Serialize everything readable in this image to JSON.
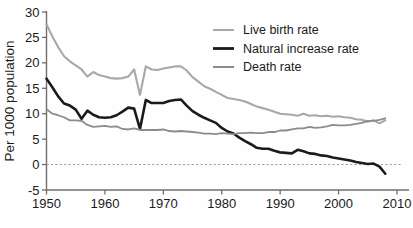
{
  "chart_data": {
    "type": "line",
    "title": "",
    "subtitle": "",
    "xlabel": "",
    "ylabel": "Per 1000 population",
    "xlim": [
      1950,
      2010
    ],
    "ylim": [
      -5,
      30
    ],
    "xticks": [
      "1950",
      "1960",
      "1970",
      "1980",
      "1990",
      "2000",
      "2010"
    ],
    "xtick_values": [
      1950,
      1960,
      1970,
      1980,
      1990,
      2000,
      2010
    ],
    "yticks": [
      "30",
      "25",
      "20",
      "15",
      "10",
      "5",
      "0",
      "-5"
    ],
    "ytick_values": [
      30,
      25,
      20,
      15,
      10,
      5,
      0,
      -5
    ],
    "grid": false,
    "zero_reference_line": 0,
    "legend_position": "top-right",
    "x": [
      1950,
      1951,
      1952,
      1953,
      1954,
      1955,
      1956,
      1957,
      1958,
      1959,
      1960,
      1961,
      1962,
      1963,
      1964,
      1965,
      1966,
      1967,
      1968,
      1969,
      1970,
      1971,
      1972,
      1973,
      1974,
      1975,
      1976,
      1977,
      1978,
      1979,
      1980,
      1981,
      1982,
      1983,
      1984,
      1985,
      1986,
      1987,
      1988,
      1989,
      1990,
      1991,
      1992,
      1993,
      1994,
      1995,
      1996,
      1997,
      1998,
      1999,
      2000,
      2001,
      2002,
      2003,
      2004,
      2005,
      2006,
      2007,
      2008
    ],
    "series": [
      {
        "name": "Live birth rate",
        "color": "#a8a8a8",
        "width": 2.1,
        "values": [
          27.6,
          25.2,
          23.1,
          21.3,
          20.3,
          19.5,
          18.7,
          17.3,
          18.2,
          17.6,
          17.3,
          17.0,
          16.9,
          17.0,
          17.3,
          18.7,
          13.7,
          19.3,
          18.7,
          18.6,
          18.9,
          19.1,
          19.3,
          19.3,
          18.5,
          17.2,
          16.3,
          15.4,
          14.9,
          14.3,
          13.7,
          13.1,
          12.9,
          12.7,
          12.4,
          11.9,
          11.4,
          11.1,
          10.8,
          10.4,
          10.0,
          9.9,
          9.8,
          9.6,
          10.0,
          9.6,
          9.7,
          9.5,
          9.6,
          9.4,
          9.5,
          9.3,
          9.2,
          8.9,
          8.8,
          8.4,
          8.7,
          8.1,
          8.7
        ]
      },
      {
        "name": "Natural increase rate",
        "color": "#1b1b1b",
        "width": 2.6,
        "values": [
          16.9,
          15.2,
          13.4,
          12.0,
          11.6,
          10.8,
          9.0,
          10.6,
          9.8,
          9.3,
          9.2,
          9.3,
          9.7,
          10.4,
          11.2,
          11.0,
          7.0,
          12.7,
          12.1,
          12.1,
          12.1,
          12.5,
          12.7,
          12.8,
          11.6,
          10.5,
          9.8,
          9.2,
          8.7,
          8.2,
          7.2,
          6.5,
          6.1,
          5.3,
          4.6,
          4.0,
          3.3,
          3.1,
          3.1,
          2.7,
          2.4,
          2.3,
          2.2,
          2.9,
          2.6,
          2.2,
          2.1,
          1.8,
          1.7,
          1.4,
          1.2,
          1.0,
          0.8,
          0.5,
          0.3,
          0.1,
          0.2,
          -0.4,
          -1.8
        ]
      },
      {
        "name": "Death rate",
        "color": "#8c8c8c",
        "width": 1.8,
        "values": [
          10.9,
          10.0,
          9.7,
          9.3,
          8.7,
          8.7,
          8.6,
          7.8,
          7.4,
          7.5,
          7.6,
          7.4,
          7.5,
          7.0,
          6.9,
          7.1,
          6.8,
          6.8,
          6.8,
          6.8,
          6.9,
          6.6,
          6.5,
          6.6,
          6.5,
          6.4,
          6.3,
          6.1,
          6.1,
          6.0,
          6.2,
          6.1,
          6.0,
          6.2,
          6.2,
          6.3,
          6.2,
          6.2,
          6.4,
          6.4,
          6.7,
          6.7,
          6.9,
          7.1,
          7.1,
          7.4,
          7.2,
          7.3,
          7.5,
          7.8,
          7.7,
          7.7,
          7.8,
          8.0,
          8.2,
          8.6,
          8.6,
          8.8,
          9.1
        ]
      }
    ]
  },
  "legend": {
    "entries": [
      {
        "label": "Live birth rate",
        "swatch_color": "#a8a8a8"
      },
      {
        "label": "Natural increase rate",
        "swatch_color": "#1b1b1b"
      },
      {
        "label": "Death rate",
        "swatch_color": "#8c8c8c"
      }
    ]
  },
  "axes": {
    "y_title": "Per 1000 population",
    "y_labels": [
      "30",
      "25",
      "20",
      "15",
      "10",
      "5",
      "0",
      "-5"
    ],
    "x_labels": [
      "1950",
      "1960",
      "1970",
      "1980",
      "1990",
      "2000",
      "2010"
    ]
  },
  "background_bleed": {
    "top": "",
    "middle": "",
    "bottom": ""
  },
  "colors": {
    "axis": "#6e6e6e",
    "text": "#1b1b1b",
    "zero_line": "#9a9a9a",
    "page": "#fefefe"
  }
}
